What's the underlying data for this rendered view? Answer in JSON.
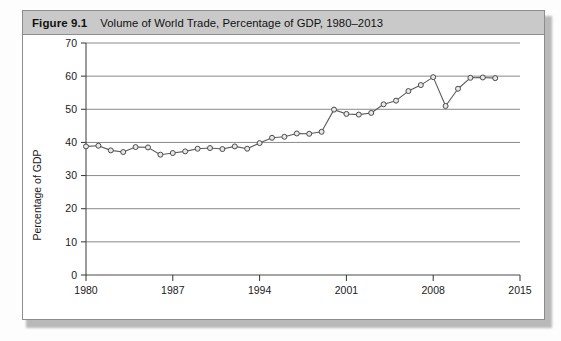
{
  "figure": {
    "label": "Figure 9.1",
    "title": "Volume of World Trade, Percentage of GDP, 1980–2013"
  },
  "colors": {
    "header_background": "#c9c9c9",
    "frame_border": "#8d8d8d",
    "gridline": "#8a8a8a",
    "series_line": "#5a5a5a",
    "marker_fill": "#e8e8e8",
    "marker_stroke": "#4a4a4a",
    "plot_background": "#ffffff"
  },
  "chart_data": {
    "type": "line",
    "title": "Volume of World Trade, Percentage of GDP, 1980–2013",
    "xlabel": "",
    "ylabel": "Percentage of GDP",
    "xlim": [
      1980,
      2015
    ],
    "ylim": [
      0,
      70
    ],
    "ytick_step": 10,
    "yticks": [
      0,
      10,
      20,
      30,
      40,
      50,
      60,
      70
    ],
    "ytick_labels": [
      "0",
      "10",
      "20",
      "30",
      "40",
      "50",
      "60",
      "70"
    ],
    "xticks": [
      1980,
      1987,
      1994,
      2001,
      2008,
      2015
    ],
    "xtick_labels": [
      "1980",
      "1987",
      "1994",
      "2001",
      "2008",
      "2015"
    ],
    "grid": "horizontal",
    "legend": "none",
    "markers": "open-circle",
    "x": [
      1980,
      1981,
      1982,
      1983,
      1984,
      1985,
      1986,
      1987,
      1988,
      1989,
      1990,
      1991,
      1992,
      1993,
      1994,
      1995,
      1996,
      1997,
      1998,
      1999,
      2000,
      2001,
      2002,
      2003,
      2004,
      2005,
      2006,
      2007,
      2008,
      2009,
      2010,
      2011,
      2012,
      2013
    ],
    "values": [
      38.8,
      39.0,
      37.6,
      37.1,
      38.6,
      38.5,
      36.3,
      36.8,
      37.3,
      38.1,
      38.3,
      38.0,
      38.8,
      38.1,
      39.8,
      41.4,
      41.7,
      42.7,
      42.6,
      43.2,
      49.9,
      48.6,
      48.4,
      48.9,
      51.5,
      52.6,
      55.5,
      57.3,
      59.7,
      51.0,
      56.2,
      59.5,
      59.6,
      59.4
    ],
    "series": [
      {
        "name": "Volume of World Trade",
        "values": [
          38.8,
          39.0,
          37.6,
          37.1,
          38.6,
          38.5,
          36.3,
          36.8,
          37.3,
          38.1,
          38.3,
          38.0,
          38.8,
          38.1,
          39.8,
          41.4,
          41.7,
          42.7,
          42.6,
          43.2,
          49.9,
          48.6,
          48.4,
          48.9,
          51.5,
          52.6,
          55.5,
          57.3,
          59.7,
          51.0,
          56.2,
          59.5,
          59.6,
          59.4
        ]
      }
    ]
  }
}
